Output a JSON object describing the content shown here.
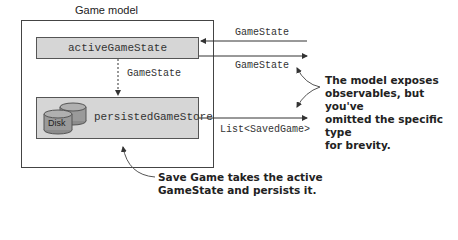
{
  "diagram": {
    "title": "Game model",
    "nodes": {
      "active": {
        "label": "activeGameState"
      },
      "persisted": {
        "label": "persistedGameStore",
        "icon_label": "Disk"
      }
    },
    "edges": {
      "internal": "GameState",
      "in_active": "GameState",
      "out_active": "GameState",
      "out_persisted": "List<SavedGame>"
    },
    "annotations": {
      "observables": [
        "The model exposes",
        "observables, but you've",
        "omitted the specific type",
        "for brevity."
      ],
      "save": [
        "Save Game takes the active",
        "GameState and persists it."
      ]
    },
    "colors": {
      "box_fill": "#d6d6d6",
      "disk_fill": "#9a9a9a",
      "line": "#444444"
    }
  }
}
